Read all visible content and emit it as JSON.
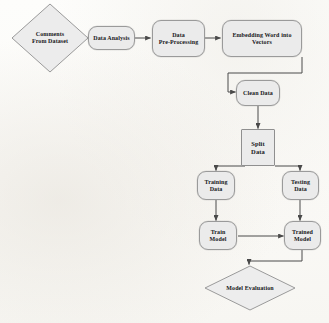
{
  "diagram": {
    "background_color": "#fdfdfb",
    "node_fill": "#ebebeb",
    "node_stroke": "#9a9a9a",
    "edge_color": "#4a4a4a",
    "nodes": [
      {
        "id": "comments_from_dataset",
        "label": "Comments\nFrom Dataset",
        "line1": "Comments",
        "line2": "From Dataset",
        "shape": "diamond"
      },
      {
        "id": "data_analysis",
        "label": "Data Analysis",
        "line1": "Data Analysis",
        "line2": "",
        "shape": "rounded"
      },
      {
        "id": "data_pre_processing",
        "label": "Data\nPre-Processing",
        "line1": "Data",
        "line2": "Pre-Processing",
        "shape": "rounded"
      },
      {
        "id": "embedding_word_into_vectors",
        "label": "Embedding Word into\nVectors",
        "line1": "Embedding Word into",
        "line2": "Vectors",
        "shape": "rounded"
      },
      {
        "id": "clean_data",
        "label": "Clean Data",
        "line1": "Clean Data",
        "line2": "",
        "shape": "rounded"
      },
      {
        "id": "split_data",
        "label": "Split\nData",
        "line1": "Split",
        "line2": "Data",
        "shape": "rectangle"
      },
      {
        "id": "training_data",
        "label": "Training\nData",
        "line1": "Training",
        "line2": "Data",
        "shape": "rounded"
      },
      {
        "id": "testing_data",
        "label": "Testing\nData",
        "line1": "Testing",
        "line2": "Data",
        "shape": "rounded"
      },
      {
        "id": "train_model",
        "label": "Train\nModel",
        "line1": "Train",
        "line2": "Model",
        "shape": "rounded"
      },
      {
        "id": "trained_model",
        "label": "Trained\nModel",
        "line1": "Trained",
        "line2": "Model",
        "shape": "rounded"
      },
      {
        "id": "model_evaluation",
        "label": "Model Evaluation",
        "line1": "Model Evaluation",
        "line2": "",
        "shape": "diamond"
      }
    ],
    "edges": [
      {
        "from": "comments_from_dataset",
        "to": "data_analysis"
      },
      {
        "from": "data_analysis",
        "to": "data_pre_processing"
      },
      {
        "from": "data_pre_processing",
        "to": "embedding_word_into_vectors"
      },
      {
        "from": "embedding_word_into_vectors",
        "to": "clean_data"
      },
      {
        "from": "clean_data",
        "to": "split_data"
      },
      {
        "from": "split_data",
        "to": "training_data"
      },
      {
        "from": "split_data",
        "to": "testing_data"
      },
      {
        "from": "training_data",
        "to": "train_model"
      },
      {
        "from": "testing_data",
        "to": "trained_model"
      },
      {
        "from": "train_model",
        "to": "trained_model"
      },
      {
        "from": "trained_model",
        "to": "model_evaluation"
      }
    ]
  }
}
